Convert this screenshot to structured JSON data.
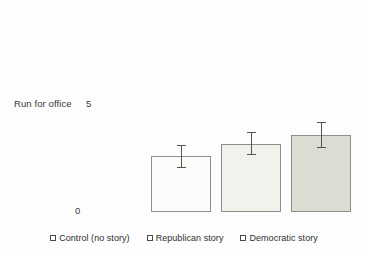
{
  "chart_data": {
    "type": "bar",
    "title": "",
    "xlabel": "",
    "ylabel": "Run for office",
    "categories": [
      "Control (no story)",
      "Republican story",
      "Democratic story"
    ],
    "values": [
      2.6,
      3.2,
      3.6
    ],
    "errors": [
      0.55,
      0.55,
      0.6
    ],
    "ylim": [
      0,
      5
    ],
    "ytick_labels": [
      "0",
      "5"
    ],
    "grid": false,
    "legend_position": "bottom",
    "series": [
      {
        "name": "Run for office",
        "values": [
          2.6,
          3.2,
          3.6
        ]
      }
    ],
    "bars": [
      {
        "label": "Control (no story)",
        "value": 2.6,
        "error": 0.55,
        "fill": "#fcfcfa",
        "stroke": "#8d8d8a"
      },
      {
        "label": "Republican story",
        "value": 3.2,
        "error": 0.55,
        "fill": "#f2f2ec",
        "stroke": "#8d8d8a"
      },
      {
        "label": "Democratic story",
        "value": 3.6,
        "error": 0.6,
        "fill": "#dcdcd2",
        "stroke": "#8d8d8a"
      }
    ]
  },
  "axis": {
    "y_label": "Run for office",
    "y_tick_top": "5",
    "y_tick_bottom": "0"
  },
  "legend": {
    "items": [
      {
        "label": "Control (no story)"
      },
      {
        "label": "Republican story"
      },
      {
        "label": "Democratic story"
      }
    ]
  },
  "colors": {
    "background": "#fdfdfd",
    "bar_stroke": "#8d8d8a",
    "error_bar": "#55554f",
    "text": "#2f2f2f"
  }
}
